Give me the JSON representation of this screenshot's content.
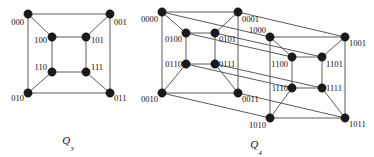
{
  "figure": {
    "background_color": "#ffffff",
    "edge_color": "#5a5a5a",
    "node_color": "#1a1a1a",
    "label_color": "#111111"
  },
  "graphs": [
    {
      "name": "Q3",
      "caption_base": "Q",
      "caption_sub": "3",
      "caption_x": 68,
      "caption_y": 144,
      "node_radius": 4.2,
      "vertices": [
        {
          "id": "000",
          "label": "000",
          "x": 28,
          "y": 14,
          "lx": 24,
          "ly": 25,
          "anchor": "end"
        },
        {
          "id": "001",
          "label": "001",
          "x": 110,
          "y": 14,
          "lx": 114,
          "ly": 25,
          "anchor": "start"
        },
        {
          "id": "010",
          "label": "010",
          "x": 28,
          "y": 93,
          "lx": 24,
          "ly": 101,
          "anchor": "end"
        },
        {
          "id": "011",
          "label": "011",
          "x": 110,
          "y": 93,
          "lx": 114,
          "ly": 101,
          "anchor": "start"
        },
        {
          "id": "100",
          "label": "100",
          "x": 52,
          "y": 37,
          "lx": 47,
          "ly": 43,
          "anchor": "end"
        },
        {
          "id": "101",
          "label": "101",
          "x": 86,
          "y": 37,
          "lx": 91,
          "ly": 43,
          "anchor": "start"
        },
        {
          "id": "110",
          "label": "110",
          "x": 52,
          "y": 72,
          "lx": 47,
          "ly": 70,
          "anchor": "end"
        },
        {
          "id": "111",
          "label": "111",
          "x": 86,
          "y": 72,
          "lx": 91,
          "ly": 70,
          "anchor": "start"
        }
      ],
      "edges": [
        [
          "000",
          "001"
        ],
        [
          "000",
          "010"
        ],
        [
          "001",
          "011"
        ],
        [
          "010",
          "011"
        ],
        [
          "100",
          "101"
        ],
        [
          "100",
          "110"
        ],
        [
          "101",
          "111"
        ],
        [
          "110",
          "111"
        ],
        [
          "000",
          "100"
        ],
        [
          "001",
          "101"
        ],
        [
          "010",
          "110"
        ],
        [
          "011",
          "111"
        ]
      ]
    },
    {
      "name": "Q4",
      "caption_base": "Q",
      "caption_sub": "4",
      "caption_x": 256,
      "caption_y": 148,
      "node_radius": 4.2,
      "vertices": [
        {
          "id": "0000",
          "label": "0000",
          "x": 162,
          "y": 12,
          "lx": 158,
          "ly": 22,
          "anchor": "end"
        },
        {
          "id": "0001",
          "label": "0001",
          "x": 238,
          "y": 12,
          "lx": 242,
          "ly": 22,
          "anchor": "start"
        },
        {
          "id": "0010",
          "label": "0010",
          "x": 162,
          "y": 93,
          "lx": 158,
          "ly": 102,
          "anchor": "end"
        },
        {
          "id": "0011",
          "label": "0011",
          "x": 238,
          "y": 93,
          "lx": 242,
          "ly": 102,
          "anchor": "start"
        },
        {
          "id": "0100",
          "label": "0100",
          "x": 186,
          "y": 33,
          "lx": 182,
          "ly": 42,
          "anchor": "end"
        },
        {
          "id": "0101",
          "label": "0101",
          "x": 215,
          "y": 33,
          "lx": 219,
          "ly": 42,
          "anchor": "start"
        },
        {
          "id": "0110",
          "label": "0110",
          "x": 186,
          "y": 64,
          "lx": 182,
          "ly": 67,
          "anchor": "end"
        },
        {
          "id": "0111",
          "label": "0111",
          "x": 215,
          "y": 64,
          "lx": 219,
          "ly": 67,
          "anchor": "start"
        },
        {
          "id": "1000",
          "label": "1000",
          "x": 270,
          "y": 37,
          "lx": 266,
          "ly": 33,
          "anchor": "end"
        },
        {
          "id": "1001",
          "label": "1001",
          "x": 345,
          "y": 37,
          "lx": 349,
          "ly": 46,
          "anchor": "start"
        },
        {
          "id": "1010",
          "label": "1010",
          "x": 270,
          "y": 118,
          "lx": 266,
          "ly": 128,
          "anchor": "end"
        },
        {
          "id": "1011",
          "label": "1011",
          "x": 345,
          "y": 118,
          "lx": 349,
          "ly": 127,
          "anchor": "start"
        },
        {
          "id": "1100",
          "label": "1100",
          "x": 292,
          "y": 57,
          "lx": 288,
          "ly": 67,
          "anchor": "end"
        },
        {
          "id": "1101",
          "label": "1101",
          "x": 322,
          "y": 57,
          "lx": 326,
          "ly": 67,
          "anchor": "start"
        },
        {
          "id": "1110",
          "label": "1110",
          "x": 292,
          "y": 88,
          "lx": 288,
          "ly": 91,
          "anchor": "end"
        },
        {
          "id": "1111",
          "label": "1111",
          "x": 322,
          "y": 88,
          "lx": 326,
          "ly": 91,
          "anchor": "start"
        }
      ],
      "edges": [
        [
          "0000",
          "0001"
        ],
        [
          "0000",
          "0010"
        ],
        [
          "0001",
          "0011"
        ],
        [
          "0010",
          "0011"
        ],
        [
          "0100",
          "0101"
        ],
        [
          "0100",
          "0110"
        ],
        [
          "0101",
          "0111"
        ],
        [
          "0110",
          "0111"
        ],
        [
          "0000",
          "0100"
        ],
        [
          "0001",
          "0101"
        ],
        [
          "0010",
          "0110"
        ],
        [
          "0011",
          "0111"
        ],
        [
          "1000",
          "1001"
        ],
        [
          "1000",
          "1010"
        ],
        [
          "1001",
          "1011"
        ],
        [
          "1010",
          "1011"
        ],
        [
          "1100",
          "1101"
        ],
        [
          "1100",
          "1110"
        ],
        [
          "1101",
          "1111"
        ],
        [
          "1110",
          "1111"
        ],
        [
          "1000",
          "1100"
        ],
        [
          "1001",
          "1101"
        ],
        [
          "1010",
          "1110"
        ],
        [
          "1011",
          "1111"
        ],
        [
          "0000",
          "1000"
        ],
        [
          "0001",
          "1001"
        ],
        [
          "0010",
          "1010"
        ],
        [
          "0011",
          "1011"
        ],
        [
          "0100",
          "1100"
        ],
        [
          "0101",
          "1101"
        ],
        [
          "0110",
          "1110"
        ],
        [
          "0111",
          "1111"
        ]
      ]
    }
  ]
}
